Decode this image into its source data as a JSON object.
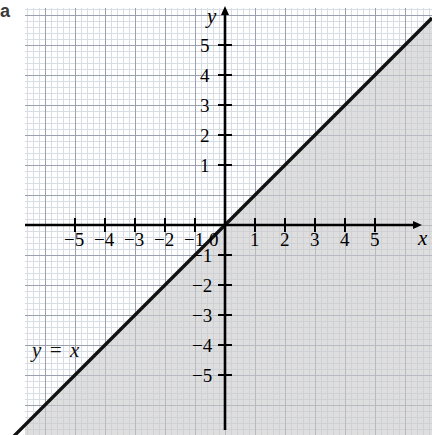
{
  "part_label": "a",
  "chart_data": {
    "type": "line",
    "title": "",
    "xlabel": "x",
    "ylabel": "y",
    "xlim": [
      -6.6,
      6.9
    ],
    "ylim": [
      -6.9,
      7.2
    ],
    "grid": true,
    "grid_major_step": 1,
    "grid_minor_step": 0.2,
    "legend": "none",
    "x_ticks": [
      -5,
      -4,
      -3,
      -2,
      -1,
      1,
      2,
      3,
      4,
      5
    ],
    "x_tick_labels": [
      "−5",
      "−4",
      "−3",
      "−2",
      "−1",
      "1",
      "2",
      "3",
      "4",
      "5"
    ],
    "y_ticks": [
      -5,
      -4,
      -3,
      -2,
      -1,
      1,
      2,
      3,
      4,
      5
    ],
    "y_tick_labels": [
      "−5",
      "−4",
      "−3",
      "−2",
      "−1",
      "1",
      "2",
      "3",
      "4",
      "5"
    ],
    "origin_label": "0",
    "series": [
      {
        "name": "y = x",
        "equation": "y = x",
        "label": "y = x",
        "slope": 1,
        "intercept": 0,
        "x": [
          -6.6,
          6.9
        ],
        "values": [
          -6.6,
          6.9
        ],
        "style": "solid",
        "color": "#111111"
      }
    ],
    "shaded_region": {
      "description": "region below and right of the line y = x",
      "inequality": "y ≤ x",
      "color": "#c9c9c9"
    }
  },
  "axis_letters": {
    "x": "x",
    "y": "y"
  },
  "colors": {
    "line": "#111111",
    "axis": "#000000",
    "shade": "#c9c9c9",
    "grid_major": "#9aa0b0",
    "grid_minor": "#d8dce5",
    "background": "#ffffff"
  }
}
